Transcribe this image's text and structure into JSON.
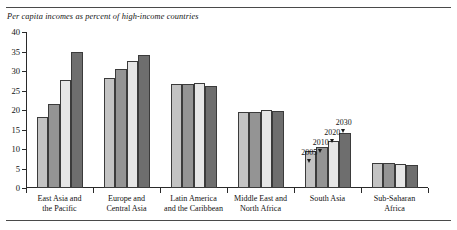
{
  "chart_data": {
    "type": "bar",
    "title": "Per capita incomes as percent of high-income countries",
    "xlabel": "",
    "ylabel": "",
    "ylim": [
      0,
      40
    ],
    "yticks": [
      0,
      5,
      10,
      15,
      20,
      25,
      30,
      35,
      40
    ],
    "grid": false,
    "legend_position": "none",
    "categories": [
      "East Asia and\nthe Pacific",
      "Europe and\nCentral Asia",
      "Latin America\nand the Caribbean",
      "Middle East and\nNorth Africa",
      "South Asia",
      "Sub-Saharan\nAfrica"
    ],
    "category_labels": [
      [
        "East Asia and",
        "the Pacific"
      ],
      [
        "Europe and",
        "Central Asia"
      ],
      [
        "Latin America",
        "and the Caribbean"
      ],
      [
        "Middle East and",
        "North Africa"
      ],
      [
        "South Asia",
        ""
      ],
      [
        "Sub-Saharan",
        "Africa"
      ]
    ],
    "series": [
      {
        "name": "2005",
        "color": "#c3c3c3",
        "values": [
          18.2,
          28.2,
          26.6,
          19.4,
          9.6,
          6.3
        ]
      },
      {
        "name": "2010",
        "color": "#949494",
        "values": [
          21.6,
          30.6,
          26.6,
          19.6,
          10.6,
          6.3
        ]
      },
      {
        "name": "2020",
        "color": "#e6e6e6",
        "values": [
          27.8,
          32.6,
          27.0,
          19.9,
          12.1,
          6.2
        ]
      },
      {
        "name": "2030",
        "color": "#6e6e6e",
        "values": [
          35.0,
          34.1,
          26.2,
          19.7,
          14.0,
          5.8
        ]
      }
    ],
    "annotations": [
      {
        "text": "2005",
        "category": "South Asia",
        "series": "2005"
      },
      {
        "text": "2010",
        "category": "South Asia",
        "series": "2010"
      },
      {
        "text": "2020",
        "category": "South Asia",
        "series": "2020"
      },
      {
        "text": "2030",
        "category": "South Asia",
        "series": "2030"
      }
    ]
  }
}
